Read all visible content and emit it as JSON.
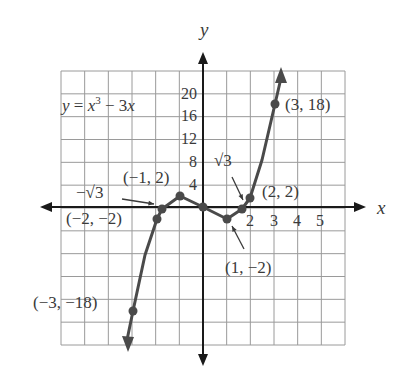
{
  "chart_data": {
    "type": "line",
    "title": "",
    "function_label": "y = x³ − 3x",
    "function_label_parts": {
      "y": "y",
      "eq": " = ",
      "x": "x",
      "exp": "3",
      "rest": " − 3",
      "x2": "x"
    },
    "xlabel": "x",
    "ylabel": "y",
    "x_tick_labels": [
      "2",
      "3",
      "4",
      "5"
    ],
    "x_ticks": [
      2,
      3,
      4,
      5
    ],
    "y_tick_labels": [
      "4",
      "8",
      "12",
      "16",
      "20"
    ],
    "y_ticks": [
      4,
      8,
      12,
      16,
      20
    ],
    "grid": true,
    "grid_note": "12 columns × 12 rows; 1 unit per column, 4 units per row in y-label scale (labels 4..20), curve drawn schematically",
    "xlim": [
      -6,
      6
    ],
    "ylim": [
      -6,
      6
    ],
    "points": [
      {
        "x": -3,
        "y": -18,
        "label": "(−3, −18)"
      },
      {
        "x": -2,
        "y": -2,
        "label": "(−2, −2)"
      },
      {
        "x": -1.732,
        "y": 0,
        "label": "−√3"
      },
      {
        "x": -1,
        "y": 2,
        "label": "(−1, 2)"
      },
      {
        "x": 0,
        "y": 0,
        "label": ""
      },
      {
        "x": 1,
        "y": -2,
        "label": "(1, −2)"
      },
      {
        "x": 1.732,
        "y": 0,
        "label": "√3"
      },
      {
        "x": 2,
        "y": 2,
        "label": "(2, 2)"
      },
      {
        "x": 3,
        "y": 18,
        "label": "(3, 18)"
      }
    ],
    "series": [
      {
        "name": "y = x^3 - 3x",
        "x": [
          -3,
          -2,
          -1.732,
          -1,
          0,
          1,
          1.732,
          2,
          3
        ],
        "y": [
          -18,
          -2,
          0,
          2,
          0,
          -2,
          0,
          2,
          18
        ]
      }
    ],
    "colors": {
      "curve": "#4a4a4a",
      "grid": "#9a9a9a",
      "axis": "#1a1a1a",
      "text": "#3a3a3a"
    }
  }
}
